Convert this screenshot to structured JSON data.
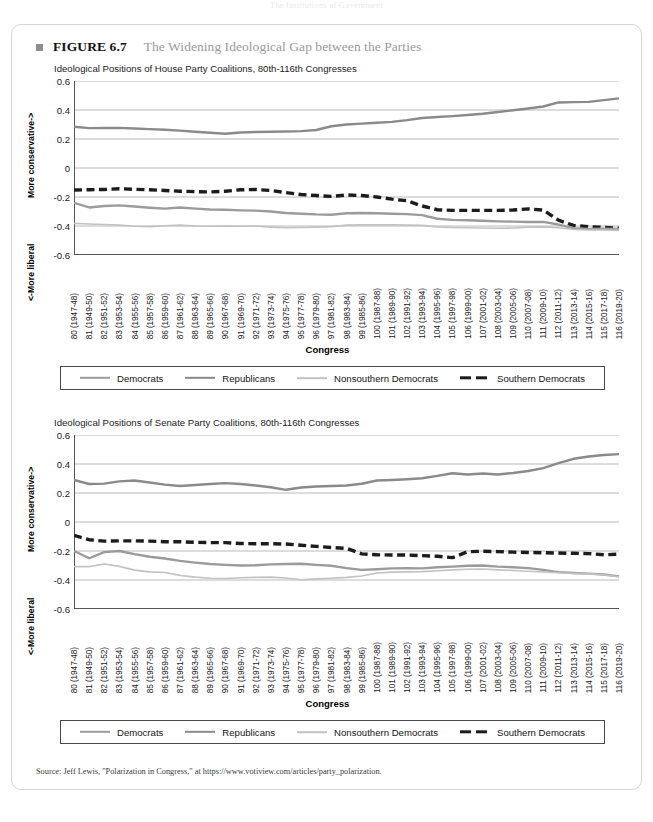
{
  "running_head": "The Institutions of Government",
  "figure": {
    "marker": "square-bullet",
    "label": "FIGURE 6.7",
    "title": "The Widening Ideological Gap between the Parties"
  },
  "source": {
    "text": "Source: Jeff Lewis, \"Polarization in Congress,\" at https://www.votiview.com/articles/party_polarization."
  },
  "legend": {
    "items": [
      {
        "label": "Democrats",
        "style": "solid-med",
        "color": "#9b9b9b"
      },
      {
        "label": "Republicans",
        "style": "solid-dark",
        "color": "#8a8a8a"
      },
      {
        "label": "Nonsouthern Democrats",
        "style": "solid-light",
        "color": "#c2c2c2"
      },
      {
        "label": "Southern Democrats",
        "style": "dashed",
        "color": "#1c1c1c"
      }
    ]
  },
  "axis": {
    "y_title_top": "More conservative->",
    "y_title_bottom": "<-More liberal",
    "x_title": "Congress",
    "y_ticks": [
      "0.6",
      "0.4",
      "0.2",
      "0",
      "-0.2",
      "-0.4",
      "-0.6"
    ]
  },
  "chart_data": [
    {
      "type": "line",
      "id": "house",
      "title": "Ideological Positions of House Party Coalitions, 80th-116th Congresses",
      "xlabel": "Congress",
      "ylabel": "More conservative-> / <-More liberal",
      "ylim": [
        -0.6,
        0.6
      ],
      "yticks": [
        0.6,
        0.4,
        0.2,
        0,
        -0.2,
        -0.4,
        -0.6
      ],
      "grid": true,
      "legend_position": "below",
      "categories": [
        "80 (1947-48)",
        "81 (1949-50)",
        "82 (1951-52)",
        "83 (1953-54)",
        "84 (1955-56)",
        "85 (1957-58)",
        "86 (1959-60)",
        "87 (1961-62)",
        "88 (1963-64)",
        "89 (1965-66)",
        "90 (1967-68)",
        "91 (1969-70)",
        "92 (1971-72)",
        "93 (1973-74)",
        "94 (1975-76)",
        "95 (1977-78)",
        "96 (1979-80)",
        "97 (1981-82)",
        "98 (1983-84)",
        "99 (1985-86)",
        "100 (1987-88)",
        "101 (1989-90)",
        "102 (1991-92)",
        "103 (1993-94)",
        "104 (1995-96)",
        "105 (1997-98)",
        "106 (1999-00)",
        "107 (2001-02)",
        "108 (2003-04)",
        "109 (2005-06)",
        "110 (2007-08)",
        "111 (2009-10)",
        "112 (2011-12)",
        "113 (2013-14)",
        "114 (2015-16)",
        "115 (2017-18)",
        "116 (2019-20)"
      ],
      "series": [
        {
          "name": "Republicans",
          "color": "#8a8a8a",
          "style": "solid",
          "width": 2.4,
          "values": [
            0.285,
            0.275,
            0.276,
            0.277,
            0.272,
            0.268,
            0.264,
            0.258,
            0.25,
            0.243,
            0.236,
            0.245,
            0.248,
            0.25,
            0.252,
            0.254,
            0.262,
            0.288,
            0.3,
            0.306,
            0.312,
            0.318,
            0.33,
            0.345,
            0.352,
            0.358,
            0.366,
            0.374,
            0.386,
            0.398,
            0.41,
            0.424,
            0.452,
            0.454,
            0.456,
            0.468,
            0.48
          ]
        },
        {
          "name": "Southern Democrats",
          "color": "#1c1c1c",
          "style": "dashed",
          "width": 3.4,
          "values": [
            -0.152,
            -0.15,
            -0.148,
            -0.143,
            -0.147,
            -0.15,
            -0.155,
            -0.16,
            -0.163,
            -0.165,
            -0.16,
            -0.15,
            -0.148,
            -0.155,
            -0.17,
            -0.183,
            -0.19,
            -0.196,
            -0.186,
            -0.19,
            -0.2,
            -0.215,
            -0.226,
            -0.262,
            -0.288,
            -0.292,
            -0.292,
            -0.292,
            -0.292,
            -0.29,
            -0.282,
            -0.29,
            -0.36,
            -0.396,
            -0.405,
            -0.41,
            -0.415
          ]
        },
        {
          "name": "Democrats",
          "color": "#9b9b9b",
          "style": "solid",
          "width": 2.4,
          "values": [
            -0.24,
            -0.272,
            -0.262,
            -0.258,
            -0.266,
            -0.274,
            -0.28,
            -0.272,
            -0.28,
            -0.286,
            -0.288,
            -0.292,
            -0.294,
            -0.3,
            -0.31,
            -0.315,
            -0.32,
            -0.322,
            -0.312,
            -0.31,
            -0.312,
            -0.315,
            -0.318,
            -0.325,
            -0.35,
            -0.358,
            -0.36,
            -0.364,
            -0.368,
            -0.37,
            -0.372,
            -0.372,
            -0.39,
            -0.415,
            -0.42,
            -0.418,
            -0.42
          ]
        },
        {
          "name": "Nonsouthern Democrats",
          "color": "#c2c2c2",
          "style": "solid",
          "width": 1.6,
          "values": [
            -0.382,
            -0.386,
            -0.39,
            -0.394,
            -0.402,
            -0.404,
            -0.398,
            -0.394,
            -0.4,
            -0.402,
            -0.4,
            -0.402,
            -0.4,
            -0.408,
            -0.412,
            -0.41,
            -0.408,
            -0.404,
            -0.394,
            -0.392,
            -0.392,
            -0.392,
            -0.394,
            -0.396,
            -0.406,
            -0.41,
            -0.412,
            -0.414,
            -0.416,
            -0.414,
            -0.408,
            -0.406,
            -0.412,
            -0.424,
            -0.428,
            -0.428,
            -0.43
          ]
        }
      ]
    },
    {
      "type": "line",
      "id": "senate",
      "title": "Ideological Positions of Senate Party Coalitions, 80th-116th Congresses",
      "xlabel": "Congress",
      "ylabel": "More conservative-> / <-More liberal",
      "ylim": [
        -0.6,
        0.6
      ],
      "yticks": [
        0.6,
        0.4,
        0.2,
        0,
        -0.2,
        -0.4,
        -0.6
      ],
      "grid": true,
      "legend_position": "below",
      "categories": [
        "80 (1947-48)",
        "81 (1949-50)",
        "82 (1951-52)",
        "83 (1953-54)",
        "84 (1955-56)",
        "85 (1957-58)",
        "86 (1959-60)",
        "87 (1961-62)",
        "88 (1963-64)",
        "89 (1965-66)",
        "90 (1967-68)",
        "91 (1969-70)",
        "92 (1971-72)",
        "93 (1973-74)",
        "94 (1975-76)",
        "95 (1977-78)",
        "96 (1979-80)",
        "97 (1981-82)",
        "98 (1983-84)",
        "99 (1985-86)",
        "100 (1987-88)",
        "101 (1989-90)",
        "102 (1991-92)",
        "103 (1993-94)",
        "104 (1995-96)",
        "105 (1997-98)",
        "106 (1999-00)",
        "107 (2001-02)",
        "108 (2003-04)",
        "109 (2005-06)",
        "110 (2007-08)",
        "111 (2009-10)",
        "112 (2011-12)",
        "113 (2013-14)",
        "114 (2015-16)",
        "115 (2017-18)",
        "116 (2019-20)"
      ],
      "series": [
        {
          "name": "Republicans",
          "color": "#8a8a8a",
          "style": "solid",
          "width": 2.4,
          "values": [
            0.29,
            0.262,
            0.265,
            0.28,
            0.286,
            0.272,
            0.258,
            0.248,
            0.255,
            0.262,
            0.268,
            0.262,
            0.252,
            0.24,
            0.222,
            0.238,
            0.245,
            0.248,
            0.252,
            0.264,
            0.286,
            0.29,
            0.295,
            0.302,
            0.318,
            0.336,
            0.328,
            0.334,
            0.328,
            0.338,
            0.352,
            0.372,
            0.406,
            0.436,
            0.452,
            0.462,
            0.468
          ]
        },
        {
          "name": "Southern Democrats",
          "color": "#1c1c1c",
          "style": "dashed",
          "width": 3.4,
          "values": [
            -0.092,
            -0.122,
            -0.132,
            -0.13,
            -0.13,
            -0.132,
            -0.136,
            -0.136,
            -0.14,
            -0.142,
            -0.142,
            -0.148,
            -0.15,
            -0.15,
            -0.152,
            -0.16,
            -0.168,
            -0.176,
            -0.182,
            -0.22,
            -0.226,
            -0.228,
            -0.228,
            -0.232,
            -0.236,
            -0.246,
            -0.205,
            -0.202,
            -0.204,
            -0.208,
            -0.21,
            -0.212,
            -0.214,
            -0.216,
            -0.218,
            -0.226,
            -0.222
          ]
        },
        {
          "name": "Democrats",
          "color": "#9b9b9b",
          "style": "solid",
          "width": 2.4,
          "values": [
            -0.2,
            -0.25,
            -0.208,
            -0.2,
            -0.222,
            -0.24,
            -0.252,
            -0.268,
            -0.28,
            -0.29,
            -0.296,
            -0.3,
            -0.298,
            -0.292,
            -0.29,
            -0.288,
            -0.296,
            -0.302,
            -0.318,
            -0.33,
            -0.326,
            -0.32,
            -0.318,
            -0.32,
            -0.312,
            -0.308,
            -0.302,
            -0.3,
            -0.308,
            -0.312,
            -0.318,
            -0.33,
            -0.346,
            -0.352,
            -0.356,
            -0.362,
            -0.375
          ]
        },
        {
          "name": "Nonsouthern Democrats",
          "color": "#c2c2c2",
          "style": "solid",
          "width": 1.6,
          "values": [
            -0.308,
            -0.308,
            -0.29,
            -0.306,
            -0.332,
            -0.344,
            -0.348,
            -0.368,
            -0.38,
            -0.388,
            -0.39,
            -0.384,
            -0.382,
            -0.38,
            -0.386,
            -0.398,
            -0.392,
            -0.388,
            -0.382,
            -0.372,
            -0.352,
            -0.346,
            -0.344,
            -0.342,
            -0.336,
            -0.33,
            -0.326,
            -0.324,
            -0.33,
            -0.334,
            -0.34,
            -0.344,
            -0.35,
            -0.354,
            -0.358,
            -0.364,
            -0.378
          ]
        }
      ]
    }
  ]
}
